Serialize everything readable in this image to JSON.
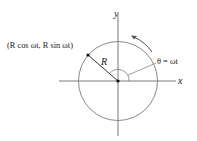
{
  "diagram": {
    "type": "uniform-circular-motion",
    "labels": {
      "x_axis": "x",
      "y_axis": "y",
      "radius": "R",
      "point": "(R cos ωt, R sin ωt)",
      "angle": "θ = ωt"
    },
    "geometry": {
      "center": [
        118,
        80
      ],
      "radius": 39,
      "point": [
        88,
        55
      ],
      "rotation": "counterclockwise"
    },
    "colors": {
      "circle": "#7a7a7a",
      "axes": "#6a6a6a",
      "text": "#222222",
      "point": "#111111"
    }
  }
}
